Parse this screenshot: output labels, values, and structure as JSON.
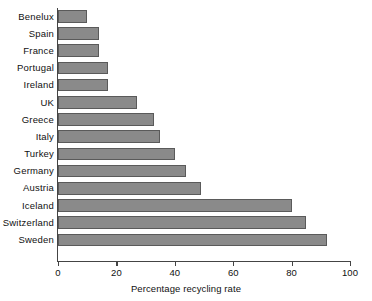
{
  "chart_data": {
    "type": "bar",
    "orientation": "horizontal",
    "title": "",
    "xlabel": "Percentage recycling rate",
    "ylabel": "",
    "categories": [
      "Benelux",
      "Spain",
      "France",
      "Portugal",
      "Ireland",
      "UK",
      "Greece",
      "Italy",
      "Turkey",
      "Germany",
      "Austria",
      "Iceland",
      "Switzerland",
      "Sweden"
    ],
    "values": [
      10,
      14,
      14,
      17,
      17,
      27,
      33,
      35,
      40,
      44,
      49,
      80,
      85,
      92
    ],
    "xlim": [
      0,
      100
    ],
    "xticks": [
      0,
      20,
      40,
      60,
      80,
      100
    ],
    "xtick_labels": [
      "0",
      "20",
      "40",
      "60",
      "80",
      "100"
    ],
    "grid": false,
    "legend": null,
    "bar_fill_color": "#8a8a8a",
    "bar_edge_color": "#5a5a5a",
    "axis_color": "#444444",
    "background_color": "#ffffff"
  }
}
